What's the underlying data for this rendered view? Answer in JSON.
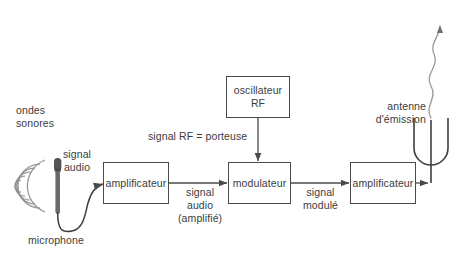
{
  "diagram": {
    "language": "fr",
    "colors": {
      "stroke": "#4a4a4a",
      "text": "#3b3b3b",
      "background": "#ffffff",
      "microphone": "#5a5a5a",
      "wave": "#8a8a8a"
    },
    "blocks": [
      {
        "id": "amplificateur-1",
        "label": "amplificateur"
      },
      {
        "id": "oscillateur-rf",
        "label": "oscillateur\nRF"
      },
      {
        "id": "modulateur",
        "label": "modulateur"
      },
      {
        "id": "amplificateur-2",
        "label": "amplificateur"
      }
    ],
    "labels": {
      "ondes_sonores": "ondes\nsonores",
      "microphone": "microphone",
      "signal_audio": "signal\naudio",
      "signal_rf_porteuse": "signal RF = porteuse",
      "signal_audio_amplifie": "signal\naudio\n(amplifié)",
      "signal_module": "signal\nmodulé",
      "antenne_emission": "antenne\nd'émission"
    },
    "icons": {
      "microphone": "microphone-icon",
      "sound_waves": "sound-waves-icon",
      "antenna": "antenna-fork-icon",
      "radio_wave": "radio-wave-icon"
    }
  }
}
